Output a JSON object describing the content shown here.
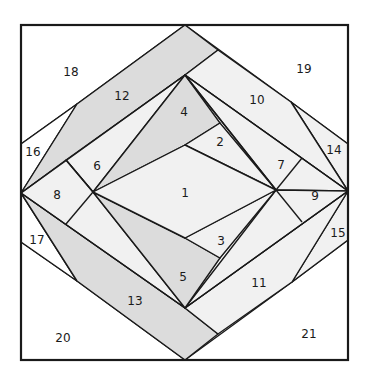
{
  "colors": {
    "white": "#ffffff",
    "light": "#f1f1f1",
    "medium": "#dcdcdc",
    "outline": "#1a1a1a"
  },
  "pieces": [
    {
      "id": "1",
      "label": "1",
      "shade": "light"
    },
    {
      "id": "2",
      "label": "2",
      "shade": "light"
    },
    {
      "id": "3",
      "label": "3",
      "shade": "light"
    },
    {
      "id": "4",
      "label": "4",
      "shade": "medium"
    },
    {
      "id": "5",
      "label": "5",
      "shade": "medium"
    },
    {
      "id": "6",
      "label": "6",
      "shade": "light"
    },
    {
      "id": "7",
      "label": "7",
      "shade": "light"
    },
    {
      "id": "8",
      "label": "8",
      "shade": "light"
    },
    {
      "id": "9",
      "label": "9",
      "shade": "light"
    },
    {
      "id": "10",
      "label": "10",
      "shade": "light"
    },
    {
      "id": "11",
      "label": "11",
      "shade": "light"
    },
    {
      "id": "12",
      "label": "12",
      "shade": "medium"
    },
    {
      "id": "13",
      "label": "13",
      "shade": "medium"
    },
    {
      "id": "14",
      "label": "14",
      "shade": "light"
    },
    {
      "id": "15",
      "label": "15",
      "shade": "light"
    },
    {
      "id": "16",
      "label": "16",
      "shade": "white"
    },
    {
      "id": "17",
      "label": "17",
      "shade": "white"
    },
    {
      "id": "18",
      "label": "18",
      "shade": "white"
    },
    {
      "id": "19",
      "label": "19",
      "shade": "white"
    },
    {
      "id": "20",
      "label": "20",
      "shade": "white"
    },
    {
      "id": "21",
      "label": "21",
      "shade": "white"
    }
  ]
}
